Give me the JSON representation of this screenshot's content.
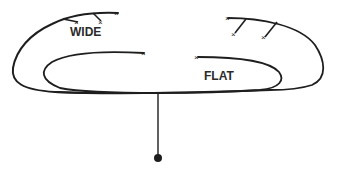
{
  "diagram": {
    "labels": {
      "wide": "WIDE",
      "flat": "FLAT"
    },
    "colors": {
      "line": "#1e1e1e",
      "background": "#ffffff"
    },
    "elements": [
      {
        "id": "wide-loop",
        "label": "WIDE",
        "description": "outer wide loop with branch ticks at top-left"
      },
      {
        "id": "flat-loop",
        "label": "FLAT",
        "description": "inner flat elongated loop"
      },
      {
        "id": "right-loop",
        "description": "right loop with two diagonal branch ticks"
      },
      {
        "id": "stem",
        "description": "vertical line from bottom of loops down to a terminal dot"
      },
      {
        "id": "terminal-dot",
        "description": "filled circle at the end of the stem"
      }
    ]
  }
}
